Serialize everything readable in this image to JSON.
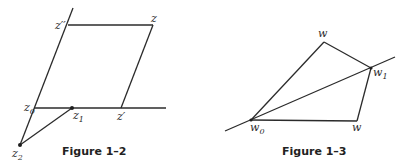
{
  "figures": [
    {
      "caption": "Figure 1–2",
      "labels": {
        "z_double_prime": "z′′",
        "z": "z",
        "z0_base": "z",
        "z0_sub": "0",
        "z1_base": "z",
        "z1_sub": "1",
        "z_prime": "z′",
        "z2_base": "z",
        "z2_sub": "2"
      }
    },
    {
      "caption": "Figure 1–3",
      "labels": {
        "w_top": "w",
        "w1_base": "w",
        "w1_sub": "1",
        "w0_base": "w",
        "w0_sub": "0",
        "w_bottom": "w"
      }
    }
  ]
}
